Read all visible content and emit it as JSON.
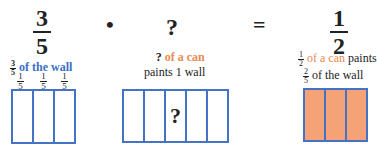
{
  "equation": {
    "left": {
      "numerator": "3",
      "denominator": "5"
    },
    "op1": "•",
    "middle": "?",
    "op2": "=",
    "right": {
      "numerator": "1",
      "denominator": "2"
    }
  },
  "captions": {
    "left": {
      "frac_num": "3",
      "frac_den": "5",
      "text": "of the wall",
      "color": "#3a6fc4"
    },
    "middle": {
      "q": "?",
      "colored": "of a can",
      "line2": "paints 1 wall",
      "color": "#e98a53"
    },
    "right": {
      "frac_num": "1",
      "frac_den": "2",
      "colored": "of a can",
      "rest": "paints",
      "frac2_num": "2",
      "frac2_den": "5",
      "line2": "of the wall"
    }
  },
  "left_diagram": {
    "labels": [
      {
        "n": "1",
        "d": "5"
      },
      {
        "n": "1",
        "d": "5"
      },
      {
        "n": "1",
        "d": "5"
      }
    ],
    "cells": 3
  },
  "middle_diagram": {
    "cells": 5,
    "mark": "?"
  },
  "right_diagram": {
    "cells": 3,
    "fill": "#f4a276"
  }
}
